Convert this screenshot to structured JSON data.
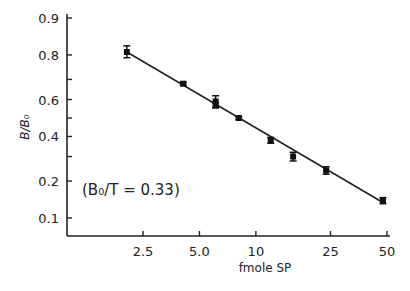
{
  "chart_data": {
    "type": "scatter",
    "title": "",
    "xlabel": "fmole SP",
    "ylabel": "B/B₀",
    "x_scale": "log",
    "y_scale": "logit",
    "xlim": [
      1.4,
      52
    ],
    "ylim": [
      0.07,
      0.92
    ],
    "x_ticks": [
      2.5,
      5.0,
      10,
      25,
      50
    ],
    "x_tick_labels": [
      "2.5",
      "5.0",
      "10",
      "25",
      "50"
    ],
    "y_ticks": [
      0.1,
      0.2,
      0.3,
      0.4,
      0.5,
      0.6,
      0.7,
      0.8,
      0.9
    ],
    "y_tick_labels": [
      "0.1",
      "0.2",
      "",
      "0.4",
      "",
      "0.6",
      "",
      "0.8",
      "0.9"
    ],
    "grid": false,
    "legend": null,
    "annotation": "(B₀/T = 0.33)",
    "series": [
      {
        "name": "standard curve",
        "marker": "square with error bars",
        "x": [
          2.05,
          4.1,
          6.1,
          6.1,
          8.1,
          12.0,
          15.8,
          23.7,
          47.6
        ],
        "y": [
          0.81,
          0.68,
          0.59,
          0.57,
          0.5,
          0.38,
          0.3,
          0.24,
          0.14
        ],
        "y_err": [
          0.02,
          0.008,
          0.03,
          0.015,
          0.008,
          0.015,
          0.02,
          0.015,
          0.008
        ]
      },
      {
        "name": "fit line",
        "type": "line",
        "x": [
          2.05,
          47.6
        ],
        "y": [
          0.81,
          0.135
        ]
      }
    ]
  }
}
